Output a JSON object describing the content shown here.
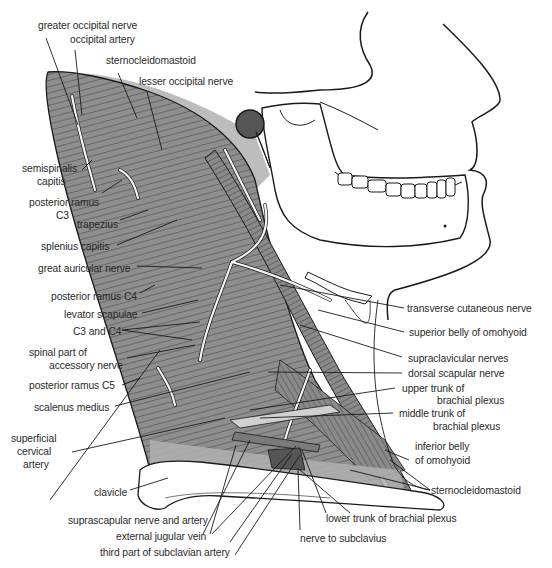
{
  "diagram": {
    "colors": {
      "muscle_fill": "#8e8e8e",
      "muscle_light": "#b4b4b4",
      "shade_band": "#c8c8c8",
      "outline": "#1a1a1a",
      "nerve": "#f4f4f4",
      "text": "#2a2a2a",
      "background": "#ffffff"
    },
    "labels": {
      "greater_occipital_nerve": "greater occipital nerve",
      "occipital_artery": "occipital artery",
      "sternocleidomastoid_top": "sternocleidomastoid",
      "lesser_occipital_nerve": "lesser occipital nerve",
      "semispinalis_capitis_1": "semispinalis",
      "semispinalis_capitis_2": "capitis",
      "posterior_ramus_c3_1": "posterior ramus",
      "posterior_ramus_c3_2": "C3",
      "trapezius": "trapezius",
      "splenius_capitis": "splenius capitis",
      "great_auricular_nerve": "great auricular nerve",
      "posterior_ramus_c4": "posterior ramus C4",
      "levator_scapulae": "levator scapulae",
      "c3_and_c4": "C3 and C4",
      "spinal_accessory_1": "spinal part of",
      "spinal_accessory_2": "accessory nerve",
      "posterior_ramus_c5": "posterior ramus C5",
      "scalenus_medius": "scalenus medius",
      "superficial_cervical_artery_1": "superficial",
      "superficial_cervical_artery_2": "cervical",
      "superficial_cervical_artery_3": "artery",
      "clavicle": "clavicle",
      "suprascapular_nerve_artery": "suprascapular nerve and artery",
      "external_jugular_vein": "external jugular vein",
      "third_part_subclavian_artery": "third part of subclavian artery",
      "nerve_to_subclavius": "nerve to subclavius",
      "lower_trunk_brachial_plexus": "lower trunk  of brachial plexus",
      "sternocleidomastoid_bottom": "sternocleidomastoid",
      "inferior_belly_omohyoid_1": "inferior belly",
      "inferior_belly_omohyoid_2": "of omohyoid",
      "middle_trunk_1": "middle trunk of",
      "middle_trunk_2": "brachial plexus",
      "upper_trunk_1": "upper trunk of",
      "upper_trunk_2": "brachial plexus",
      "dorsal_scapular_nerve": "dorsal scapular nerve",
      "supraclavicular_nerves": "supraclavicular nerves",
      "superior_belly_omohyoid": "superior belly of omohyoid",
      "transverse_cutaneous_nerve": "transverse cutaneous nerve"
    }
  }
}
